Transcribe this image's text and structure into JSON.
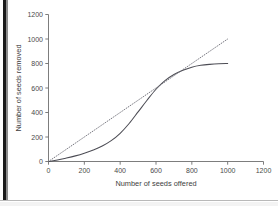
{
  "figure": {
    "background_color": "#ffffff",
    "gutter_color": "#1b1b1b"
  },
  "chart_data": {
    "type": "line",
    "title": "",
    "subtitle": "",
    "xlabel": "Number of seeds offered",
    "ylabel": "Number of seeds removed",
    "xlim": [
      0,
      1200
    ],
    "ylim": [
      0,
      1200
    ],
    "xticks": [
      0,
      200,
      400,
      600,
      800,
      1000,
      1200
    ],
    "yticks": [
      0,
      200,
      400,
      600,
      800,
      1000,
      1200
    ],
    "xtick_labels": [
      "0",
      "200",
      "400",
      "600",
      "800",
      "1000",
      "1200"
    ],
    "ytick_labels": [
      "0",
      "200",
      "400",
      "600",
      "800",
      "1000",
      "1200"
    ],
    "grid": false,
    "legend": false,
    "legend_position": "none",
    "series": [
      {
        "name": "Seeds removed (observed)",
        "style": "solid",
        "color": "#4d4d55",
        "x": [
          0,
          50,
          100,
          150,
          200,
          250,
          300,
          350,
          400,
          450,
          500,
          550,
          600,
          650,
          700,
          750,
          800,
          850,
          900,
          950,
          1000
        ],
        "y": [
          0,
          12,
          28,
          46,
          68,
          94,
          126,
          170,
          230,
          310,
          405,
          500,
          590,
          660,
          710,
          745,
          770,
          785,
          793,
          798,
          800
        ]
      },
      {
        "name": "1:1 reference (all seeds removed)",
        "style": "dotted",
        "color": "#6b6b75",
        "x": [
          0,
          1000
        ],
        "y": [
          0,
          1000
        ]
      }
    ]
  }
}
